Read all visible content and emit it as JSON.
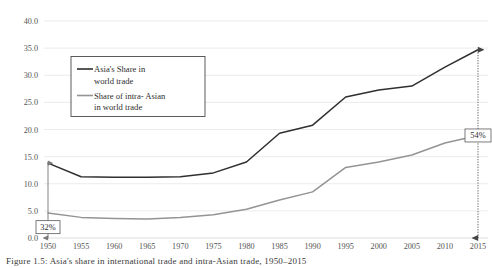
{
  "figure": {
    "caption": "Figure 1.5: Asia's share in international trade and intra-Asian trade, 1950–2015"
  },
  "chart_data": {
    "type": "line",
    "title": "",
    "xlabel": "",
    "ylabel": "",
    "ylim": [
      0,
      40
    ],
    "ytick_step": 5,
    "grid": true,
    "legend_position": "upper-left-inside",
    "categories": [
      "1950",
      "1955",
      "1960",
      "1965",
      "1970",
      "1975",
      "1980",
      "1985",
      "1990",
      "1995",
      "2000",
      "2005",
      "2010",
      "2015"
    ],
    "yticks": [
      "0.0",
      "5.0",
      "10.0",
      "15.0",
      "20.0",
      "25.0",
      "30.0",
      "35.0",
      "40.0"
    ],
    "series": [
      {
        "name": "Asia's Share in world trade",
        "color": "#2f2f2f",
        "values": [
          13.8,
          11.3,
          11.2,
          11.2,
          11.3,
          12.0,
          14.0,
          19.3,
          20.8,
          26.0,
          27.3,
          28.0,
          31.5,
          34.7
        ]
      },
      {
        "name": "Share of intra-Asian in world trade",
        "color": "#949494",
        "values": [
          4.6,
          3.8,
          3.6,
          3.5,
          3.8,
          4.3,
          5.3,
          7.0,
          8.5,
          13.0,
          14.0,
          15.3,
          17.5,
          18.9
        ]
      }
    ],
    "annotations": [
      {
        "id": "share-1950",
        "label": "32%",
        "at_category": "1950",
        "from_value": 13.8,
        "to_value": 0.0,
        "arrow_style": "solid-double",
        "label_at_value": 2.0
      },
      {
        "id": "share-2015",
        "label": "54%",
        "at_category": "2015",
        "from_value": 34.7,
        "to_value": 0.0,
        "arrow_style": "dotted-double",
        "label_at_value": 18.9
      }
    ]
  },
  "legend": {
    "entries": [
      {
        "line1": "Asia's Share in",
        "line2": "world trade"
      },
      {
        "line1": "Share of intra- Asian",
        "line2": "in world trade"
      }
    ]
  }
}
